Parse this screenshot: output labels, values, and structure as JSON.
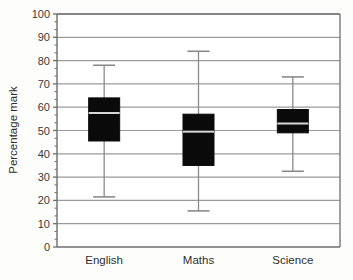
{
  "chart_data": {
    "type": "box",
    "title": "",
    "xlabel": "",
    "ylabel": "Percentage mark",
    "ylim": [
      0,
      100
    ],
    "ytick_step": 10,
    "yticks": [
      0,
      10,
      20,
      30,
      40,
      50,
      60,
      70,
      80,
      90,
      100
    ],
    "ytick_labels": [
      "0",
      "10",
      "20",
      "30",
      "40",
      "50",
      "60",
      "70",
      "80",
      "90",
      "100"
    ],
    "minor_ticks": true,
    "grid": "horizontal",
    "legend": "none",
    "categories": [
      "English",
      "Maths",
      "Science"
    ],
    "boxes": [
      {
        "category": "English",
        "min": 21.5,
        "q1": 45.5,
        "median": 57.5,
        "q3": 64,
        "max": 78
      },
      {
        "category": "Maths",
        "min": 15.5,
        "q1": 35,
        "median": 49.5,
        "q3": 57,
        "max": 84
      },
      {
        "category": "Science",
        "min": 32.5,
        "q1": 49,
        "median": 53,
        "q3": 59,
        "max": 73
      }
    ],
    "colors": {
      "box_fill": "#0a0a0a",
      "box_edge": "#0a0a0a",
      "median": "#d8d8d8",
      "whisker": "#8a8a8a",
      "cap": "#8a8a8a",
      "gridline": "#9a9a9a",
      "axis": "#6e6e6e",
      "background": "#fdfdfb",
      "plot_background": "#ffffff",
      "text": "#2f2f2f"
    }
  },
  "geometry": {
    "plot_left": 57,
    "plot_right": 340,
    "plot_top": 14,
    "plot_bottom": 247,
    "box_half_width": 15.5,
    "cap_half_width": 11,
    "cat_label_y": 264,
    "ylabel_x": 17,
    "ylabel_y": 130
  }
}
